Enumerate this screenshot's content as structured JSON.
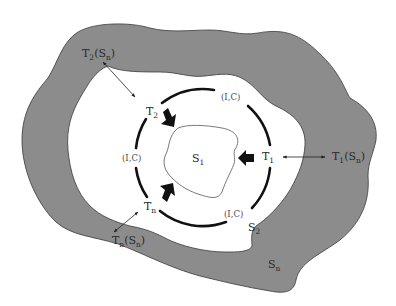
{
  "diagram": {
    "colors": {
      "background": "#ffffff",
      "outer_region": "#8c8c8c",
      "outline": "#3a3a3a",
      "inner_region": "#ffffff",
      "ring": "#111111",
      "text": "#2a2a2a"
    },
    "regions": {
      "s1": {
        "base": "S",
        "sub": "1"
      },
      "s2": {
        "base": "S",
        "sub": "2"
      },
      "sn": {
        "base": "S",
        "sub": "n"
      }
    },
    "transformers": {
      "t1": {
        "base": "T",
        "sub": "1"
      },
      "t2": {
        "base": "T",
        "sub": "2"
      },
      "tn": {
        "base": "T",
        "sub": "n"
      }
    },
    "outer_transformers": {
      "t1_sn": {
        "base": "T",
        "sub": "1",
        "open": "(S",
        "inner_sub": "n",
        "close": ")"
      },
      "t2_sn": {
        "base": "T",
        "sub": "2",
        "open": "(S",
        "inner_sub": "n",
        "close": ")"
      },
      "tn_sn": {
        "base": "T",
        "sub": "n",
        "open": "(S",
        "inner_sub": "n",
        "close": ")"
      }
    },
    "ring_labels": {
      "top_right": "(I,C)",
      "left": "(I,C)",
      "bottom_right": "(I,C)"
    }
  }
}
